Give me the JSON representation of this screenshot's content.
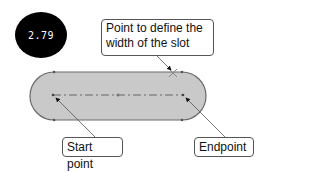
{
  "figure": {
    "step_badge": {
      "label": "2.79",
      "background": "#000000",
      "text_color": "#ffffff"
    },
    "callouts": {
      "width_point": {
        "line1": "Point to define the",
        "line2": "width of the slot"
      },
      "start_point": {
        "label": "Start point"
      },
      "end_point": {
        "label": "Endpoint"
      }
    },
    "slot": {
      "fill": "#c8c8c8",
      "outline": "#666666",
      "centerline_style": "dash-dot"
    }
  }
}
